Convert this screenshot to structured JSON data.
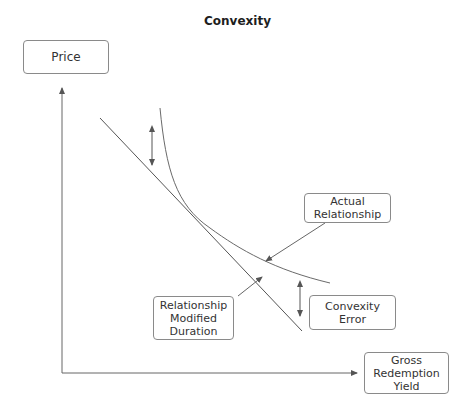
{
  "title": "Convexity",
  "axes": {
    "y_label": "Price",
    "x_label_lines": [
      "Gross",
      "Redemption",
      "Yield"
    ]
  },
  "labels": {
    "actual_relationship_lines": [
      "Actual",
      "Relationship"
    ],
    "modified_duration_lines": [
      "Relationship",
      "Modified",
      "Duration"
    ],
    "convexity_error": "Convexity Error"
  },
  "colors": {
    "line": "#555555",
    "curve": "#6a6a6a",
    "arrow": "#555555",
    "box_border": "#8a8a8a"
  }
}
